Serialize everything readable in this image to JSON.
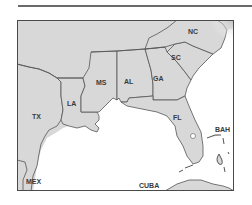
{
  "map": {
    "title": "",
    "colors": {
      "land": "#d8d8d8",
      "water": "#ffffff",
      "border": "#555555",
      "frame": "#4a4a4a",
      "label": "#3a3a3a"
    },
    "labels": {
      "nc": "NC",
      "sc": "SC",
      "ga": "GA",
      "al": "AL",
      "ms": "MS",
      "la": "LA",
      "tx": "TX",
      "fl": "FL",
      "bah": "BAH",
      "mex": "MEX",
      "cuba": "CUBA"
    }
  }
}
